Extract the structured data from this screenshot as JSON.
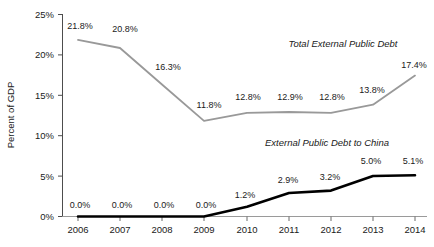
{
  "chart_data": {
    "type": "line",
    "title": "",
    "xlabel": "",
    "ylabel": "Percent of GDP",
    "categories": [
      "2006",
      "2007",
      "2008",
      "2009",
      "2010",
      "2011",
      "2012",
      "2013",
      "2014"
    ],
    "ylim": [
      0,
      25
    ],
    "ytick_labels": [
      "0%",
      "5%",
      "10%",
      "15%",
      "20%",
      "25%"
    ],
    "ytick_values": [
      0,
      5,
      10,
      15,
      20,
      25
    ],
    "grid": false,
    "legend_position": "inline-annotation",
    "series": [
      {
        "name": "Total External Public Debt",
        "color": "#999999",
        "values": [
          21.8,
          20.8,
          16.3,
          11.8,
          12.8,
          12.9,
          12.8,
          13.8,
          17.4
        ],
        "labels": [
          "21.8%",
          "20.8%",
          "16.3%",
          "11.8%",
          "12.8%",
          "12.9%",
          "12.8%",
          "13.8%",
          "17.4%"
        ]
      },
      {
        "name": "External Public Debt to China",
        "color": "#000000",
        "values": [
          0.0,
          0.0,
          0.0,
          0.0,
          1.2,
          2.9,
          3.2,
          5.0,
          5.1
        ],
        "labels": [
          "0.0%",
          "0.0%",
          "0.0%",
          "0.0%",
          "1.2%",
          "2.9%",
          "3.2%",
          "5.0%",
          "5.1%"
        ]
      }
    ],
    "annotations": [
      {
        "text": "Total External Public Debt",
        "x": 343,
        "y": 46
      },
      {
        "text": "External Public Debt to China",
        "x": 327,
        "y": 145
      }
    ]
  },
  "axis": {
    "y_title": "Percent of GDP",
    "y_ticks": [
      "25%",
      "20%",
      "15%",
      "10%",
      "5%",
      "0%"
    ],
    "x_ticks": [
      "2006",
      "2007",
      "2008",
      "2009",
      "2010",
      "2011",
      "2012",
      "2013",
      "2014"
    ]
  },
  "series_labels": {
    "total": "Total External Public Debt",
    "china": "External Public Debt to China"
  },
  "total_debt_labels": {
    "y2006": "21.8%",
    "y2007": "20.8%",
    "y2008": "16.3%",
    "y2009": "11.8%",
    "y2010": "12.8%",
    "y2011": "12.9%",
    "y2012": "12.8%",
    "y2013": "13.8%",
    "y2014": "17.4%"
  },
  "china_debt_labels": {
    "y2006": "0.0%",
    "y2007": "0.0%",
    "y2008": "0.0%",
    "y2009": "0.0%",
    "y2010": "1.2%",
    "y2011": "2.9%",
    "y2012": "3.2%",
    "y2013": "5.0%",
    "y2014": "5.1%"
  }
}
